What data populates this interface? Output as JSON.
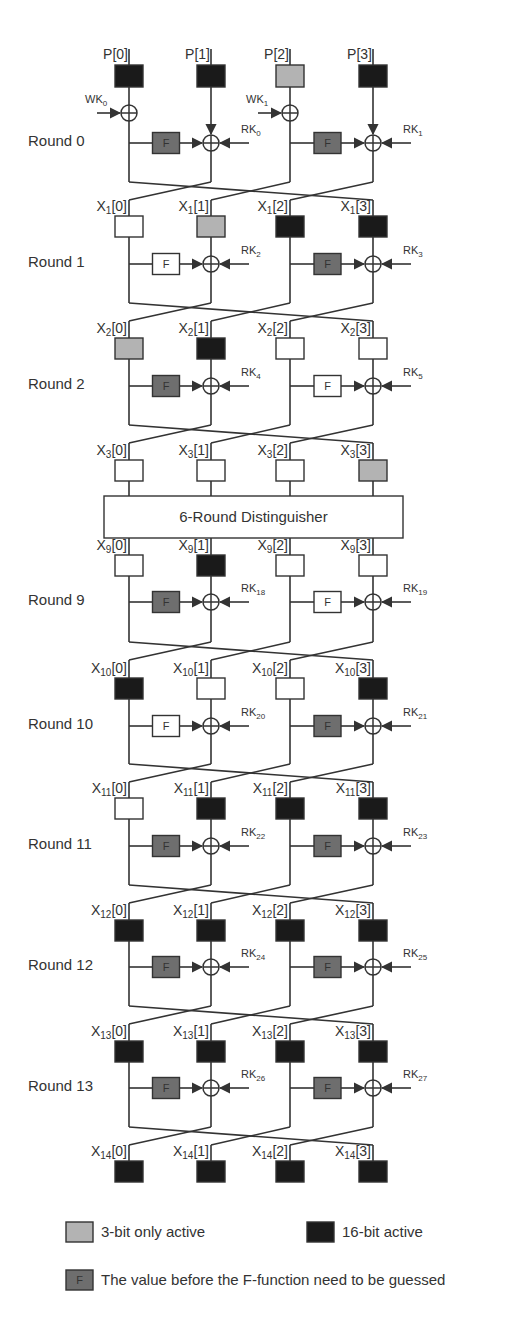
{
  "colors": {
    "inactive": "#ffffff",
    "three_bit_active": "#b3b3b3",
    "sixteen_bit_active": "#1a1a1a",
    "guessed_f": "#6e6e6e",
    "plain_f": "#ffffff",
    "line": "#333333"
  },
  "columns_x": [
    129,
    211,
    290,
    373
  ],
  "plaintext": {
    "y": 65,
    "cells": [
      {
        "label": "P[0]",
        "state": "active16"
      },
      {
        "label": "P[1]",
        "state": "active16"
      },
      {
        "label": "P[2]",
        "state": "active3"
      },
      {
        "label": "P[3]",
        "state": "active16"
      }
    ],
    "whitening_keys": [
      {
        "label": "WK",
        "sub": "0",
        "column": 0
      },
      {
        "label": "WK",
        "sub": "1",
        "column": 2
      }
    ],
    "whitening_y": 113
  },
  "rounds": [
    {
      "label": "Round 0",
      "xor_y": 143,
      "bottom_y": 182,
      "f_left": "guessed",
      "f_right": "guessed",
      "rk_left": "0",
      "rk_right": "1",
      "out": {
        "prefix": "X",
        "sub": "1",
        "y": 216,
        "cells": [
          "none",
          "active3",
          "active16",
          "active16"
        ]
      }
    },
    {
      "label": "Round 1",
      "xor_y": 264,
      "bottom_y": 303,
      "f_left": "plain",
      "f_right": "guessed",
      "rk_left": "2",
      "rk_right": "3",
      "out": {
        "prefix": "X",
        "sub": "2",
        "y": 338,
        "cells": [
          "active3",
          "active16",
          "none",
          "none"
        ]
      }
    },
    {
      "label": "Round 2",
      "xor_y": 386,
      "bottom_y": 425,
      "f_left": "guessed",
      "f_right": "plain",
      "rk_left": "4",
      "rk_right": "5",
      "out": {
        "prefix": "X",
        "sub": "3",
        "y": 460,
        "cells": [
          "none",
          "none",
          "none",
          "active3"
        ]
      }
    },
    {
      "label": "Round 9",
      "xor_y": 602,
      "bottom_y": 642,
      "f_left": "guessed",
      "f_right": "plain",
      "rk_left": "18",
      "rk_right": "19",
      "out": {
        "prefix": "X",
        "sub": "10",
        "y": 678,
        "cells": [
          "active16",
          "none",
          "none",
          "active16"
        ]
      }
    },
    {
      "label": "Round 10",
      "xor_y": 726,
      "bottom_y": 764,
      "f_left": "plain",
      "f_right": "guessed",
      "rk_left": "20",
      "rk_right": "21",
      "out": {
        "prefix": "X",
        "sub": "11",
        "y": 798,
        "cells": [
          "none",
          "active16",
          "active16",
          "active16"
        ]
      }
    },
    {
      "label": "Round 11",
      "xor_y": 846,
      "bottom_y": 885,
      "f_left": "guessed",
      "f_right": "guessed",
      "rk_left": "22",
      "rk_right": "23",
      "out": {
        "prefix": "X",
        "sub": "12",
        "y": 920,
        "cells": [
          "active16",
          "active16",
          "active16",
          "active16"
        ]
      }
    },
    {
      "label": "Round 12",
      "xor_y": 967,
      "bottom_y": 1006,
      "f_left": "guessed",
      "f_right": "guessed",
      "rk_left": "24",
      "rk_right": "25",
      "out": {
        "prefix": "X",
        "sub": "13",
        "y": 1041,
        "cells": [
          "active16",
          "active16",
          "active16",
          "active16"
        ]
      }
    },
    {
      "label": "Round 13",
      "xor_y": 1088,
      "bottom_y": 1127,
      "f_left": "guessed",
      "f_right": "guessed",
      "rk_left": "26",
      "rk_right": "27",
      "out": {
        "prefix": "X",
        "sub": "14",
        "y": 1161,
        "cells": [
          "active16",
          "active16",
          "active16",
          "active16"
        ]
      }
    }
  ],
  "distinguisher": {
    "label": "6-Round Distinguisher",
    "x": 104,
    "y": 496,
    "w": 299,
    "h": 42,
    "out": {
      "prefix": "X",
      "sub": "9",
      "y": 555,
      "cells": [
        "none",
        "active16",
        "none",
        "none"
      ]
    }
  },
  "key_prefix": "RK",
  "f_text": "F",
  "legend": {
    "items": [
      {
        "text": "3-bit only active",
        "swatch": "active3",
        "x": 66,
        "y": 1222
      },
      {
        "text": "16-bit active",
        "swatch": "active16",
        "x": 307,
        "y": 1222
      },
      {
        "text": "The value before the F-function need to be guessed",
        "swatch": "guessed",
        "x": 66,
        "y": 1270
      }
    ]
  }
}
